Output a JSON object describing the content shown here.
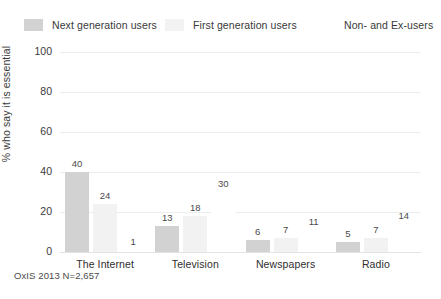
{
  "legend": {
    "items": [
      {
        "label": "Next generation users",
        "color": "#d2d2d2"
      },
      {
        "label": "First generation users",
        "color": "#f2f2f2"
      },
      {
        "label": "Non- and Ex-users",
        "color": "#ffffff"
      }
    ]
  },
  "footer": {
    "source": "OxIS 2013 N=2,657"
  },
  "chart_data": {
    "type": "bar",
    "title": "",
    "xlabel": "",
    "ylabel": "% who say it is essential",
    "ylim": [
      0,
      100
    ],
    "yticks": [
      0,
      20,
      40,
      60,
      80,
      100
    ],
    "ytick_labels": [
      "0",
      "20",
      "40",
      "60",
      "80",
      "100"
    ],
    "grid": true,
    "legend_position": "top",
    "categories": [
      "The Internet",
      "Television",
      "Newspapers",
      "Radio"
    ],
    "series": [
      {
        "name": "Next generation users",
        "color": "#d2d2d2",
        "values": [
          40,
          13,
          6,
          5
        ]
      },
      {
        "name": "First generation users",
        "color": "#f2f2f2",
        "values": [
          24,
          18,
          7,
          7
        ]
      },
      {
        "name": "Non- and Ex-users",
        "color": "#ffffff",
        "values": [
          1,
          30,
          11,
          14
        ]
      }
    ],
    "data_labels": [
      [
        "40",
        "24",
        "1"
      ],
      [
        "13",
        "18",
        "30"
      ],
      [
        "6",
        "7",
        "11"
      ],
      [
        "5",
        "7",
        "14"
      ]
    ]
  }
}
